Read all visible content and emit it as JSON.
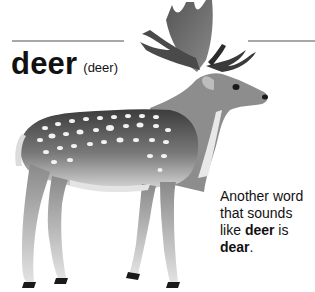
{
  "entry": {
    "word": "deer",
    "pronunciation": "(deer)"
  },
  "note": {
    "text_before": "Another word that sounds like ",
    "word_bold": "deer",
    "text_middle": " is ",
    "homophone_bold": "dear",
    "text_after": "."
  },
  "illustration": {
    "subject": "fallow deer with antlers and white spots",
    "style": "grayscale"
  },
  "colors": {
    "rule": "#a8a8a8",
    "text": "#111111",
    "background": "#ffffff"
  }
}
